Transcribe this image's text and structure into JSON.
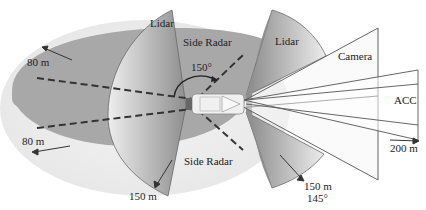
{
  "diagram": {
    "labels": {
      "lidar_rear": "Lidar",
      "lidar_front": "Lidar",
      "side_radar_top": "Side Radar",
      "side_radar_bottom": "Side Radar",
      "angle_rear": "150°",
      "angle_front": "145°",
      "range_80_top": "80 m",
      "range_80_bottom": "80 m",
      "range_150_rear": "150 m",
      "range_150_front": "150 m",
      "camera": "Camera",
      "acc": "ACC",
      "range_200": "200 m"
    },
    "colors": {
      "radar_outer": "#ececec",
      "radar_inner": "#a9a9a9",
      "lidar_dark": "#8f8f8f",
      "lidar_light": "#e2e2e2",
      "line": "#555555"
    }
  }
}
